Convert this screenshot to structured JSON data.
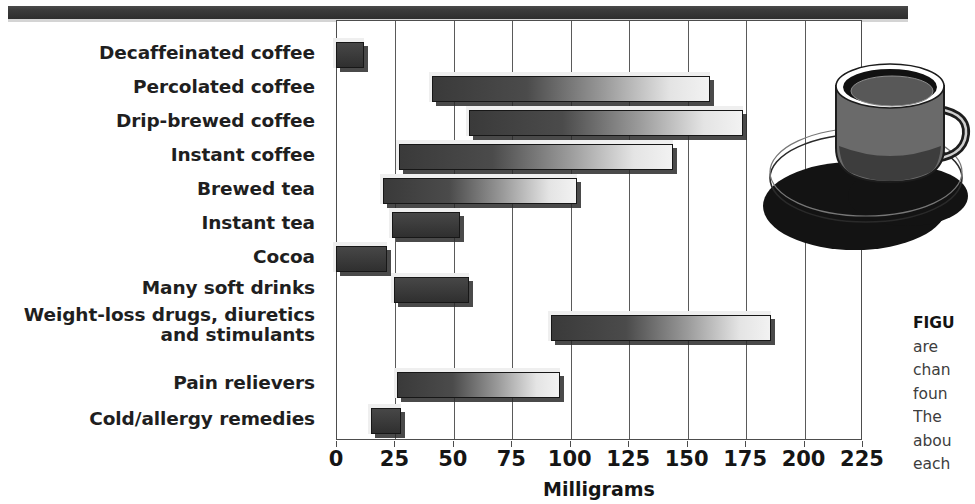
{
  "chart_data": {
    "type": "bar",
    "orientation": "horizontal",
    "title": "",
    "xlabel": "Milligrams",
    "ylabel": "",
    "xlim": [
      0,
      225
    ],
    "xticks": [
      0,
      25,
      50,
      75,
      100,
      125,
      150,
      175,
      200,
      225
    ],
    "xtick_labels": [
      "0",
      "25",
      "50",
      "75",
      "100",
      "125",
      "150",
      "175",
      "200",
      "225"
    ],
    "grid": true,
    "legend": null,
    "note": "Each bar is a floating range bar spanning a low-to-high caffeine amount.",
    "categories": [
      "Decaffeinated coffee",
      "Percolated coffee",
      "Drip-brewed coffee",
      "Instant coffee",
      "Brewed tea",
      "Instant tea",
      "Cocoa",
      "Many soft drinks",
      "Weight-loss drugs, diuretics\nand stimulants",
      "Pain relievers",
      "Cold/allergy remedies"
    ],
    "bars": [
      {
        "label": "Decaffeinated coffee",
        "start": 0,
        "end": 12
      },
      {
        "label": "Percolated coffee",
        "start": 41,
        "end": 160
      },
      {
        "label": "Drip-brewed coffee",
        "start": 57,
        "end": 174
      },
      {
        "label": "Instant coffee",
        "start": 27,
        "end": 144
      },
      {
        "label": "Brewed tea",
        "start": 20,
        "end": 103
      },
      {
        "label": "Instant tea",
        "start": 24,
        "end": 53
      },
      {
        "label": "Cocoa",
        "start": 0,
        "end": 22
      },
      {
        "label": "Many soft drinks",
        "start": 25,
        "end": 57
      },
      {
        "label": "Weight-loss drugs, diuretics and stimulants",
        "start": 92,
        "end": 186
      },
      {
        "label": "Pain relievers",
        "start": 26,
        "end": 96
      },
      {
        "label": "Cold/allergy remedies",
        "start": 15,
        "end": 28
      }
    ]
  },
  "axis": {
    "x_title": "Milligrams"
  },
  "caption": {
    "lead": "FIGU",
    "lines": [
      "are",
      "chan",
      "foun",
      "The",
      "abou",
      "each"
    ]
  },
  "illustration": {
    "name": "coffee-cup-and-saucer"
  },
  "colors": {
    "bar_dark": "#3a3a3a",
    "bar_light": "#f2f2f2",
    "outline": "#171717",
    "rule": "#333333",
    "text": "#1a1a1a"
  }
}
